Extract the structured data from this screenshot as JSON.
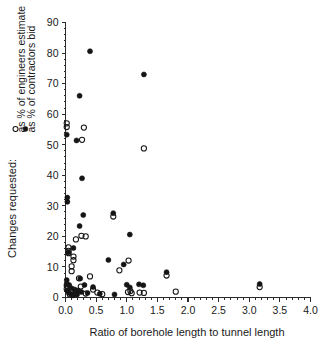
{
  "chart_data": {
    "type": "scatter",
    "title": "",
    "xlabel": "Ratio of borehole length to tunnel length",
    "ylabel": "Changes requested:",
    "xlim": [
      0.0,
      4.0
    ],
    "ylim": [
      0,
      90
    ],
    "xticks": [
      0.0,
      0.5,
      1.0,
      1.5,
      2.0,
      2.5,
      3.0,
      3.5,
      4.0
    ],
    "xticklabels": [
      "0.0",
      "0.5",
      "1.0",
      "1.5",
      "2.0",
      "2.5",
      "3.0",
      "3.5",
      "4.0"
    ],
    "yticks": [
      0,
      10,
      20,
      30,
      40,
      50,
      60,
      70,
      80,
      90
    ],
    "yticklabels": [
      "0",
      "10",
      "20",
      "30",
      "40",
      "50",
      "60",
      "70",
      "80",
      "90"
    ],
    "xtick_minor_step": 0.1,
    "ytick_minor_step": 2,
    "grid": false,
    "legend_position": "left-outside-rotated",
    "series": [
      {
        "name": "as % of engineers estimate",
        "marker": "open-circle",
        "color": "#151515",
        "points": [
          [
            0.02,
            57.0
          ],
          [
            0.02,
            55.8
          ],
          [
            0.3,
            55.6
          ],
          [
            0.27,
            51.6
          ],
          [
            1.28,
            48.8
          ],
          [
            0.26,
            20.2
          ],
          [
            0.33,
            20.0
          ],
          [
            0.17,
            19.0
          ],
          [
            0.05,
            16.4
          ],
          [
            0.05,
            15.3
          ],
          [
            0.05,
            14.5
          ],
          [
            0.13,
            13.4
          ],
          [
            0.13,
            12.2
          ],
          [
            0.78,
            26.5
          ],
          [
            1.03,
            12.1
          ],
          [
            0.88,
            8.9
          ],
          [
            0.4,
            6.9
          ],
          [
            0.22,
            6.3
          ],
          [
            0.1,
            10.2
          ],
          [
            0.1,
            8.6
          ],
          [
            1.65,
            7.2
          ],
          [
            0.25,
            3.6
          ],
          [
            0.45,
            2.6
          ],
          [
            0.02,
            3.9
          ],
          [
            0.02,
            2.8
          ],
          [
            0.08,
            2.0
          ],
          [
            0.17,
            1.3
          ],
          [
            0.2,
            2.2
          ],
          [
            0.33,
            1.3
          ],
          [
            0.52,
            1.6
          ],
          [
            0.6,
            1.1
          ],
          [
            1.02,
            1.8
          ],
          [
            1.08,
            1.4
          ],
          [
            1.21,
            1.6
          ],
          [
            1.28,
            1.5
          ],
          [
            1.8,
            1.9
          ],
          [
            3.17,
            3.4
          ],
          [
            1.06,
            2.1
          ],
          [
            0.07,
            1.0
          ],
          [
            0.12,
            0.8
          ]
        ]
      },
      {
        "name": "as % of contractors bid",
        "marker": "filled-circle",
        "color": "#151515",
        "points": [
          [
            0.4,
            80.6
          ],
          [
            1.28,
            73.0
          ],
          [
            0.23,
            66.0
          ],
          [
            0.02,
            53.3
          ],
          [
            0.18,
            51.4
          ],
          [
            0.27,
            39.0
          ],
          [
            0.03,
            32.7
          ],
          [
            0.03,
            31.3
          ],
          [
            0.29,
            27.0
          ],
          [
            0.78,
            27.6
          ],
          [
            0.23,
            23.4
          ],
          [
            1.05,
            20.6
          ],
          [
            0.13,
            16.2
          ],
          [
            0.05,
            14.7
          ],
          [
            0.7,
            12.3
          ],
          [
            0.95,
            10.8
          ],
          [
            0.24,
            6.2
          ],
          [
            0.02,
            5.7
          ],
          [
            0.02,
            4.6
          ],
          [
            0.06,
            4.1
          ],
          [
            0.1,
            3.0
          ],
          [
            0.15,
            2.6
          ],
          [
            0.2,
            2.1
          ],
          [
            0.26,
            1.8
          ],
          [
            0.31,
            4.1
          ],
          [
            0.36,
            1.5
          ],
          [
            0.56,
            1.2
          ],
          [
            1.0,
            4.2
          ],
          [
            1.05,
            3.3
          ],
          [
            1.2,
            4.3
          ],
          [
            1.27,
            4.0
          ],
          [
            1.65,
            8.3
          ],
          [
            3.17,
            4.4
          ],
          [
            0.05,
            1.6
          ],
          [
            0.09,
            1.1
          ],
          [
            0.14,
            0.9
          ],
          [
            0.19,
            1.0
          ],
          [
            0.45,
            3.4
          ],
          [
            0.8,
            1.0
          ],
          [
            0.03,
            2.3
          ]
        ]
      }
    ]
  },
  "legend": {
    "title": "Changes requested:",
    "entries": [
      {
        "marker": "open-circle",
        "label": "as % of engineers estimate"
      },
      {
        "marker": "filled-circle",
        "label": "as % of contractors bid"
      }
    ]
  }
}
